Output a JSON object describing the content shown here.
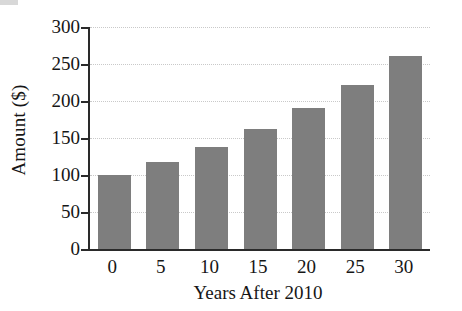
{
  "chart_data": {
    "type": "bar",
    "title": "",
    "xlabel": "Years After 2010",
    "ylabel": "Amount ($)",
    "categories": [
      "0",
      "5",
      "10",
      "15",
      "20",
      "25",
      "30"
    ],
    "values": [
      100,
      117,
      138,
      162,
      190,
      222,
      261
    ],
    "x": [
      0,
      5,
      10,
      15,
      20,
      25,
      30
    ],
    "ylim": [
      0,
      300
    ],
    "yticks": [
      0,
      50,
      100,
      150,
      200,
      250,
      300
    ],
    "ytick_labels": [
      "0",
      "50",
      "100",
      "150",
      "200",
      "250",
      "300"
    ],
    "xtick_labels": [
      "0",
      "5",
      "10",
      "15",
      "20",
      "25",
      "30"
    ],
    "grid": true,
    "grid_axis": "y",
    "legend": false,
    "legend_position": "none",
    "bar_color": "#7e7e7e",
    "axis_color": "#2a2a2a",
    "grid_color": "#c9c9c9",
    "background": "#ffffff"
  }
}
